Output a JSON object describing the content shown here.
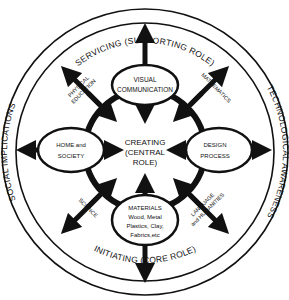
{
  "diagram": {
    "colors": {
      "ink": "#111111",
      "background": "#ffffff"
    },
    "outer_ring": {
      "top": "SERVICING (SUPPORTING ROLE)",
      "bottom": "INITIATING (CORE ROLE)",
      "left": "SOCIAL IMPLICATIONS",
      "right": "TECHNOLOGICAL AWARENESS"
    },
    "center": {
      "line1": "CREATING",
      "line2": "(CENTRAL",
      "line3": "ROLE)"
    },
    "nodes": {
      "top": {
        "line1": "VISUAL",
        "line2": "COMMUNICATION"
      },
      "left": {
        "line1": "HOME and",
        "line2": "SOCIETY"
      },
      "right": {
        "line1": "DESIGN",
        "line2": "PROCESS"
      },
      "bottom": {
        "line1": "MATERIALS",
        "line2": "Wood, Metal",
        "line3": "Plastics, Clay,",
        "line4": "Fabrics,etc"
      }
    },
    "diagonal_subjects": {
      "top_left": {
        "line1": "PHYSICAL",
        "line2": "EDUCATION"
      },
      "top_right": {
        "line1": "MATHEMATICS"
      },
      "bottom_left": {
        "line1": "SCIENCE"
      },
      "bottom_right": {
        "line1": "LANGUAGE",
        "line2": "and HUMANITIES"
      }
    }
  }
}
